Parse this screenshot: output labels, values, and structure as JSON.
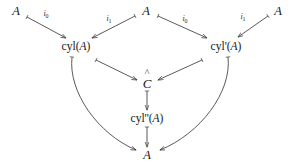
{
  "diagram": {
    "type": "commutative-diagram",
    "title": "",
    "nodes": [
      {
        "id": "A-top-left",
        "label": "A",
        "kind": "object",
        "x": 16,
        "y": 11
      },
      {
        "id": "A-top-center",
        "label": "A",
        "kind": "object",
        "x": 146,
        "y": 11
      },
      {
        "id": "A-top-right",
        "label": "A",
        "kind": "object",
        "x": 278,
        "y": 11
      },
      {
        "id": "cyl-A",
        "label": "cyl(A)",
        "kind": "cylinder",
        "x": 76,
        "y": 47
      },
      {
        "id": "cyl-prime-A",
        "label": "cyl'(A)",
        "kind": "cylinder",
        "x": 226,
        "y": 47
      },
      {
        "id": "C-hat",
        "label": "C",
        "accent": "^",
        "kind": "object",
        "x": 147,
        "y": 83
      },
      {
        "id": "cyl-dprime-A",
        "label": "cyl''(A)",
        "kind": "cylinder",
        "x": 147,
        "y": 119
      },
      {
        "id": "A-bottom",
        "label": "A",
        "kind": "object",
        "x": 147,
        "y": 155
      }
    ],
    "edges": [
      {
        "id": "e-i0-left",
        "from": "A-top-left",
        "to": "cyl-A",
        "label": "i",
        "sublabel": "0",
        "label_x": 46,
        "label_y": 14,
        "style": "straight"
      },
      {
        "id": "e-i1-center",
        "from": "A-top-center",
        "to": "cyl-A",
        "label": "i",
        "sublabel": "1",
        "label_x": 109,
        "label_y": 19,
        "style": "straight"
      },
      {
        "id": "e-i0-center",
        "from": "A-top-center",
        "to": "cyl-prime-A",
        "label": "i",
        "sublabel": "0",
        "label_x": 185,
        "label_y": 19,
        "style": "straight"
      },
      {
        "id": "e-i1-right",
        "from": "A-top-right",
        "to": "cyl-prime-A",
        "label": "i",
        "sublabel": "1",
        "label_x": 243,
        "label_y": 17,
        "style": "straight"
      },
      {
        "id": "e-cyl-to-C",
        "from": "cyl-A",
        "to": "C-hat",
        "label": "",
        "sublabel": "",
        "label_x": 122,
        "label_y": 69,
        "style": "straight"
      },
      {
        "id": "e-cylp-to-C",
        "from": "cyl-prime-A",
        "to": "C-hat",
        "label": "",
        "sublabel": "",
        "label_x": 172,
        "label_y": 69,
        "style": "straight"
      },
      {
        "id": "e-C-to-cyldp",
        "from": "C-hat",
        "to": "cyl-dprime-A",
        "label": "",
        "sublabel": "",
        "label_x": 154,
        "label_y": 101,
        "style": "straight"
      },
      {
        "id": "e-cyldp-to-A",
        "from": "cyl-dprime-A",
        "to": "A-bottom",
        "label": "",
        "sublabel": "",
        "label_x": 154,
        "label_y": 137,
        "style": "straight"
      },
      {
        "id": "e-cyl-to-A",
        "from": "cyl-A",
        "to": "A-bottom",
        "label": "",
        "sublabel": "",
        "label_x": 86,
        "label_y": 112,
        "style": "curved-left"
      },
      {
        "id": "e-cylp-to-A",
        "from": "cyl-prime-A",
        "to": "A-bottom",
        "label": "",
        "sublabel": "",
        "label_x": 210,
        "label_y": 112,
        "style": "curved-right"
      }
    ],
    "stroke_color": "#3c3c3c",
    "background_color": "#ffffff",
    "text_color": "#161616"
  }
}
